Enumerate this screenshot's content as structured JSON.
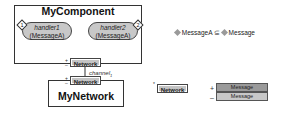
{
  "component": {
    "title": "MyComponent",
    "handlers": [
      {
        "name": "handler1",
        "type": "(MessageA)",
        "badge": "1"
      },
      {
        "name": "handler2",
        "type": "(MessageA)",
        "badge": "2"
      }
    ],
    "port": {
      "label": "Network",
      "plus": "+",
      "minus": "–"
    }
  },
  "channel": {
    "label": "channel",
    "subscript": "1"
  },
  "network": {
    "title": "MyNetwork",
    "port": {
      "label": "Network",
      "plus": "+",
      "minus": "–"
    }
  },
  "legend": {
    "subtype": {
      "left": "MessageA",
      "relation": "⊆",
      "right": "Message"
    },
    "port_def": {
      "label": "Network",
      "star": "*",
      "rows": [
        {
          "sign": "+",
          "message": "Message"
        },
        {
          "sign": "–",
          "message": "Message"
        }
      ]
    }
  },
  "colors": {
    "fill": "#c4c4c4",
    "fill_dark": "#9a9a9a",
    "stroke": "#333333"
  }
}
